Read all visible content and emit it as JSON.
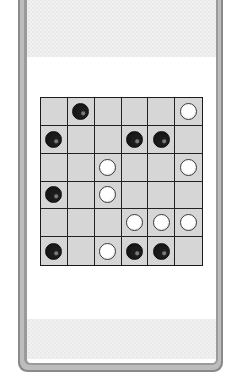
{
  "game": {
    "type": "board-game",
    "board_size": {
      "rows": 6,
      "cols": 6
    },
    "legend": {
      "B": "black-piece",
      "W": "white-piece",
      ".": "empty"
    },
    "board": [
      [
        ".",
        "B",
        ".",
        ".",
        ".",
        "W"
      ],
      [
        "B",
        ".",
        ".",
        "B",
        "B",
        "."
      ],
      [
        ".",
        ".",
        "W",
        ".",
        ".",
        "W"
      ],
      [
        "B",
        ".",
        "W",
        ".",
        ".",
        "."
      ],
      [
        ".",
        ".",
        ".",
        "W",
        "W",
        "W"
      ],
      [
        "B",
        ".",
        "W",
        "B",
        "B",
        "."
      ]
    ],
    "counts": {
      "black": 8,
      "white": 8
    }
  },
  "colors": {
    "frame_outer": "#8a8a8a",
    "frame_mid": "#bdbdbd",
    "frame_inner": "#9a9a9a",
    "cell": "#d6d6d6",
    "grid_line": "#222222",
    "black_piece": "#161616",
    "white_piece": "#ffffff",
    "pattern": "#f1f1f1"
  }
}
